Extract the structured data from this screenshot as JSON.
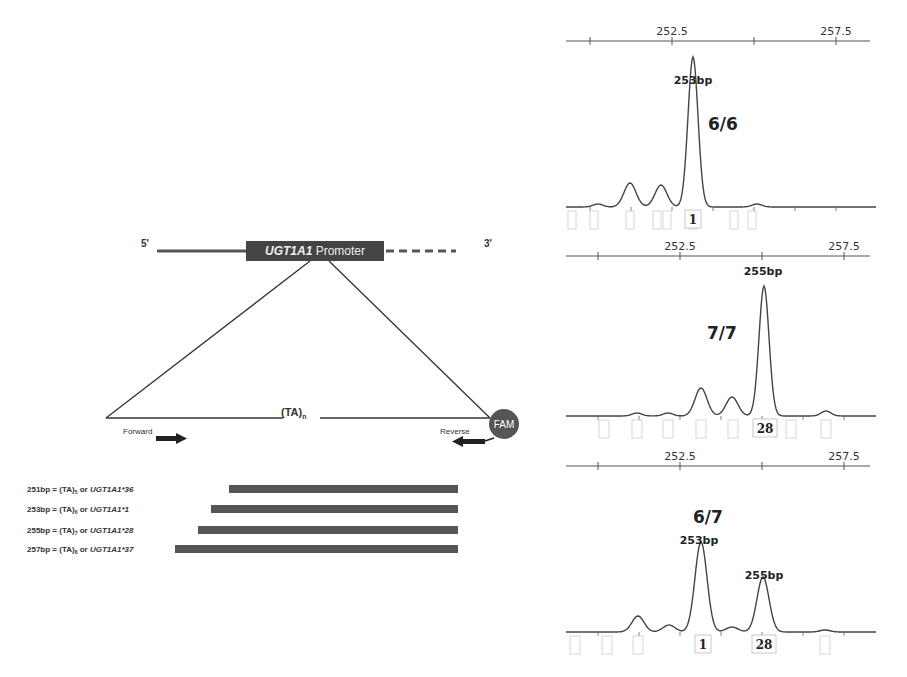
{
  "diagram": {
    "five_prime": "5'",
    "three_prime": "3'",
    "promoter_gene": "UGT1A1",
    "promoter_word": " Promoter",
    "repeat_label": "(TA)",
    "repeat_sub": "n",
    "forward_label": "Forward",
    "reverse_label": "Reverse",
    "fam_label": "FAM",
    "colors": {
      "box": "#444444",
      "bar": "#555555",
      "fam": "#555555",
      "line": "#333333"
    }
  },
  "alleles": [
    {
      "size": "251bp",
      "eq": " = (TA)",
      "sub": "5",
      "or": " or ",
      "name": "UGT1A1*36",
      "bar_x": 229,
      "bar_w": 229,
      "y": 489
    },
    {
      "size": "253bp",
      "eq": " = (TA)",
      "sub": "6",
      "or": " or ",
      "name": "UGT1A1*1",
      "bar_x": 211,
      "bar_w": 247,
      "y": 509
    },
    {
      "size": "255bp",
      "eq": " = (TA)",
      "sub": "7",
      "or": " or ",
      "name": "UGT1A1*28",
      "bar_x": 198,
      "bar_w": 260,
      "y": 530
    },
    {
      "size": "257bp",
      "eq": " = (TA)",
      "sub": "8",
      "or": " or ",
      "name": "UGT1A1*37",
      "bar_x": 175,
      "bar_w": 283,
      "y": 549
    }
  ],
  "chart_data": [
    {
      "type": "line",
      "title": "6/6",
      "x_ticks": [
        "252.5",
        "257.5"
      ],
      "peaks": [
        {
          "label": "253bp",
          "size_bp": 253,
          "relative_height": 1.0
        }
      ],
      "bin_labels": [
        "1"
      ],
      "stutter_peaks_relative": [
        0.25,
        0.22
      ]
    },
    {
      "type": "line",
      "title": "7/7",
      "x_ticks": [
        "252.5",
        "257.5"
      ],
      "peaks": [
        {
          "label": "255bp",
          "size_bp": 255,
          "relative_height": 1.0
        }
      ],
      "bin_labels": [
        "28"
      ],
      "stutter_peaks_relative": [
        0.23,
        0.15
      ]
    },
    {
      "type": "line",
      "title": "6/7",
      "x_ticks": [
        "252.5",
        "257.5"
      ],
      "peaks": [
        {
          "label": "253bp",
          "size_bp": 253,
          "relative_height": 1.0
        },
        {
          "label": "255bp",
          "size_bp": 255,
          "relative_height": 0.65
        }
      ],
      "bin_labels": [
        "1",
        "28"
      ],
      "stutter_peaks_relative": [
        0.17,
        0.06
      ]
    }
  ]
}
